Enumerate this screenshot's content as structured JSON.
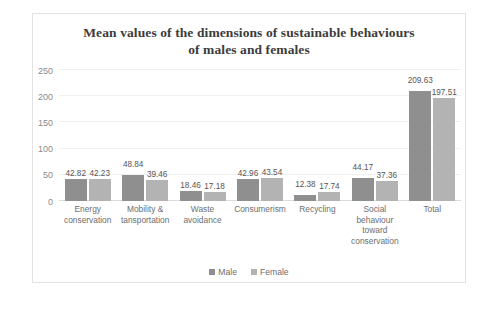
{
  "chart_data": {
    "type": "bar",
    "title": "Mean values of the dimensions of sustainable behaviours of males and females",
    "title_lines": [
      "Mean values of the dimensions of sustainable behaviours",
      "of males and females"
    ],
    "xlabel": "",
    "ylabel": "",
    "ylim": [
      0,
      250
    ],
    "yticks": [
      0,
      50,
      100,
      150,
      200,
      250
    ],
    "ytick_labels": [
      "0",
      "50",
      "100",
      "150",
      "200",
      "250"
    ],
    "grid": true,
    "legend_position": "bottom",
    "categories": [
      "Energy conservation",
      "Mobility & tansportation",
      "Waste avoidance",
      "Consumerism",
      "Recycling",
      "Social behaviour toward conservation",
      "Total"
    ],
    "category_lines": [
      [
        "Energy",
        "conservation"
      ],
      [
        "Mobility &",
        "tansportation"
      ],
      [
        "Waste",
        "avoidance"
      ],
      [
        "Consumerism"
      ],
      [
        "Recycling"
      ],
      [
        "Social",
        "behaviour",
        "toward",
        "conservation"
      ],
      [
        "Total"
      ]
    ],
    "series": [
      {
        "name": "Male",
        "color": "#8f8f8f",
        "values": [
          42.82,
          48.84,
          18.46,
          42.96,
          12.38,
          44.17,
          209.63
        ],
        "labels": [
          "42.82",
          "48.84",
          "18.46",
          "42.96",
          "12.38",
          "44.17",
          "209.63"
        ]
      },
      {
        "name": "Female",
        "color": "#b3b3b3",
        "values": [
          42.23,
          39.46,
          17.18,
          43.54,
          17.74,
          37.36,
          197.51
        ],
        "labels": [
          "42.23",
          "39.46",
          "17.18",
          "43.54",
          "17.74",
          "37.36",
          "197.51"
        ]
      }
    ]
  }
}
